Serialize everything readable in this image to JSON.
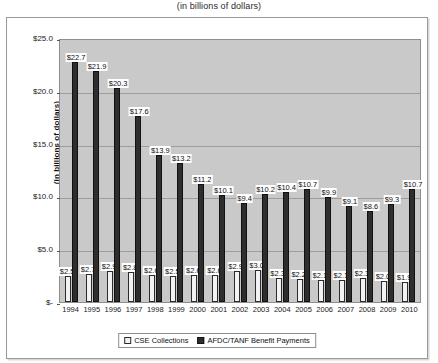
{
  "subtitle": "(in billions of dollars)",
  "legend": {
    "items": [
      {
        "label": "CSE Collections",
        "swatch": "light-swatch-icon"
      },
      {
        "label": "AFDC/TANF Benefit Payments",
        "swatch": "dark-swatch-icon"
      }
    ]
  },
  "axis": {
    "y_title": "(in billions of dollars)",
    "y_ticks": [
      "$25.0",
      "$20.0",
      "$15.0",
      "$10.0",
      "$5.0",
      "$-"
    ]
  },
  "chart_data": {
    "type": "bar",
    "title": "",
    "subtitle": "(in billions of dollars)",
    "xlabel": "",
    "ylabel": "(in billions of dollars)",
    "ylim": [
      0,
      25
    ],
    "ytick_values": [
      25.0,
      20.0,
      15.0,
      10.0,
      5.0,
      0
    ],
    "ytick_labels": [
      "$25.0",
      "$20.0",
      "$15.0",
      "$10.0",
      "$5.0",
      "$-"
    ],
    "grid": true,
    "legend_position": "bottom",
    "categories": [
      "1994",
      "1995",
      "1996",
      "1997",
      "1998",
      "1999",
      "2000",
      "2001",
      "2002",
      "2003",
      "2004",
      "2005",
      "2006",
      "2007",
      "2008",
      "2009",
      "2010"
    ],
    "series": [
      {
        "name": "CSE Collections",
        "values": [
          2.5,
          2.7,
          2.9,
          2.8,
          2.6,
          2.5,
          2.6,
          2.6,
          2.9,
          3.0,
          2.3,
          2.2,
          2.1,
          2.1,
          2.3,
          2.0,
          1.9
        ],
        "labels": [
          "$2.5",
          "$2.7",
          "$2.9",
          "$2.8",
          "$2.6",
          "$2.5",
          "$2.6",
          "$2.6",
          "$2.9",
          "$3.0",
          "$2.3",
          "$2.2",
          "$2.1",
          "$2.1",
          "$2.3",
          "$2.0",
          "$1.9"
        ]
      },
      {
        "name": "AFDC/TANF Benefit Payments",
        "values": [
          22.7,
          21.9,
          20.3,
          17.6,
          13.9,
          13.2,
          11.2,
          10.1,
          9.4,
          10.2,
          10.4,
          10.7,
          9.9,
          9.1,
          8.6,
          9.3,
          10.7
        ],
        "labels": [
          "$22.7",
          "$21.9",
          "$20.3",
          "$17.6",
          "$13.9",
          "$13.2",
          "$11.2",
          "$10.1",
          "$9.4",
          "$10.2",
          "$10.4",
          "$10.7",
          "$9.9",
          "$9.1",
          "$8.6",
          "$9.3",
          "$10.7"
        ]
      }
    ]
  }
}
